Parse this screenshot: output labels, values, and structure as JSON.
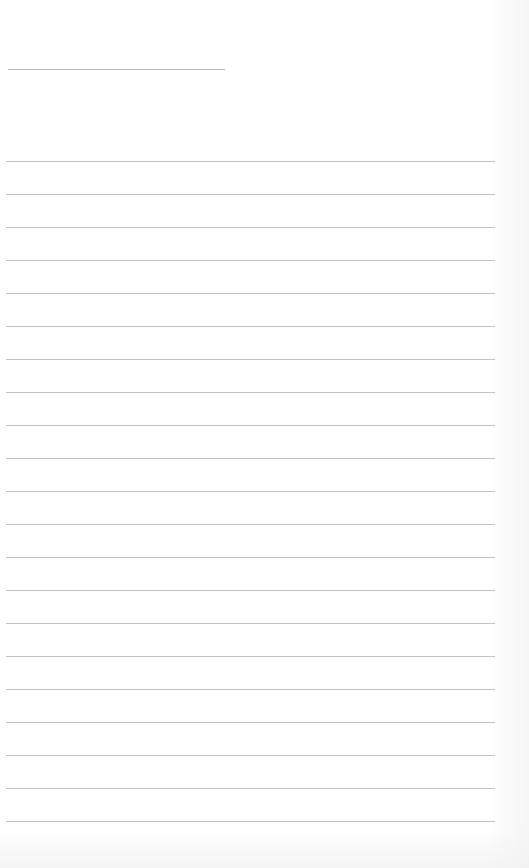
{
  "document": {
    "type": "lined-paper",
    "header": {
      "title_line": "",
      "line_top": 69,
      "line_left": 8,
      "line_width": 217
    },
    "rules": {
      "count": 21,
      "first_top": 161,
      "spacing": 33,
      "left": 6,
      "width": 489,
      "color": "#c4c4c4"
    },
    "lines_text": [
      "",
      "",
      "",
      "",
      "",
      "",
      "",
      "",
      "",
      "",
      "",
      "",
      "",
      "",
      "",
      "",
      "",
      "",
      "",
      "",
      ""
    ]
  }
}
